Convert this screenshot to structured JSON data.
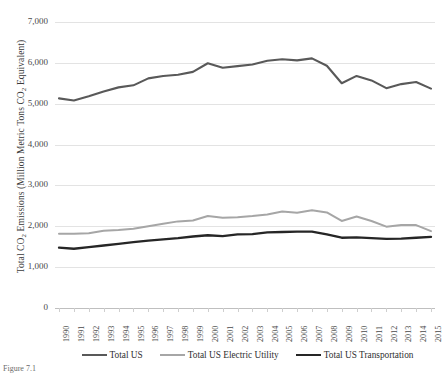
{
  "chart_data": {
    "type": "line",
    "title": "",
    "xlabel": "",
    "ylabel": "Total CO2 Emissions (Million Metric Tons CO2 Equivalent)",
    "ylim": [
      0,
      7000
    ],
    "ytick_labels": [
      "7,000",
      "6,000",
      "5,000",
      "4,000",
      "3,000",
      "2,000",
      "1,000",
      "0"
    ],
    "ytick_values": [
      7000,
      6000,
      5000,
      4000,
      3000,
      2000,
      1000,
      0
    ],
    "grid": true,
    "legend_position": "bottom",
    "categories": [
      1990,
      1991,
      1992,
      1993,
      1994,
      1995,
      1996,
      1997,
      1998,
      1999,
      2000,
      2001,
      2002,
      2003,
      2004,
      2005,
      2006,
      2007,
      2008,
      2009,
      2010,
      2011,
      2012,
      2013,
      2014,
      2015
    ],
    "x_tick_labels": [
      "1990",
      "1991",
      "1992",
      "1993",
      "1994",
      "1995",
      "1996",
      "1997",
      "1998",
      "1999",
      "2000",
      "2001",
      "2002",
      "2003",
      "2004",
      "2005",
      "2006",
      "2007",
      "2008",
      "2009",
      "2010",
      "2011",
      "2012",
      "2013",
      "2014",
      "2015"
    ],
    "series": [
      {
        "name": "Total US",
        "color": "#595959",
        "width": 2.1,
        "values": [
          5130,
          5080,
          5180,
          5300,
          5400,
          5450,
          5620,
          5680,
          5710,
          5780,
          5990,
          5880,
          5920,
          5960,
          6050,
          6090,
          6060,
          6110,
          5930,
          5500,
          5680,
          5570,
          5380,
          5480,
          5530,
          5370
        ]
      },
      {
        "name": "Total US Electric Utility",
        "color": "#a6a6a6",
        "width": 2.0,
        "values": [
          1820,
          1820,
          1830,
          1890,
          1910,
          1940,
          2000,
          2060,
          2120,
          2140,
          2250,
          2210,
          2220,
          2250,
          2290,
          2360,
          2330,
          2390,
          2340,
          2130,
          2240,
          2130,
          1990,
          2030,
          2030,
          1880
        ]
      },
      {
        "name": "Total US Transportation",
        "color": "#262626",
        "width": 2.3,
        "values": [
          1480,
          1450,
          1490,
          1530,
          1570,
          1610,
          1650,
          1680,
          1710,
          1750,
          1780,
          1760,
          1800,
          1810,
          1850,
          1860,
          1870,
          1870,
          1800,
          1720,
          1730,
          1710,
          1690,
          1700,
          1720,
          1740
        ]
      }
    ]
  },
  "caption": "Figure 7.1"
}
